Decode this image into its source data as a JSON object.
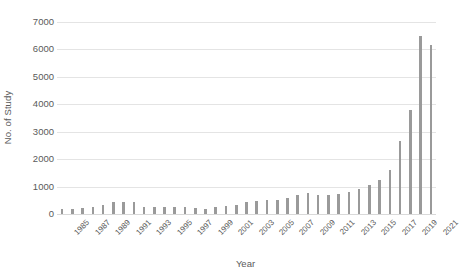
{
  "figure": {
    "background_color": "#ffffff",
    "bar_color": "#9a9a9a",
    "grid_color": "#e4e4e4",
    "text_color": "#5a5a5a"
  },
  "chart_data": {
    "type": "bar",
    "title": "",
    "subtitle": "",
    "xlabel": "Year",
    "ylabel": "No. of Study",
    "ylim": [
      0,
      7000
    ],
    "ytick_values": [
      0,
      1000,
      2000,
      3000,
      4000,
      5000,
      6000,
      7000
    ],
    "ytick_labels": [
      "0",
      "1000",
      "2000",
      "3000",
      "4000",
      "5000",
      "6000",
      "7000"
    ],
    "grid": "horizontal",
    "legend": null,
    "legend_position": "none",
    "xtick_labels": [
      "1985",
      "1987",
      "1989",
      "1991",
      "1993",
      "1995",
      "1997",
      "1999",
      "2001",
      "2003",
      "2005",
      "2007",
      "2009",
      "2011",
      "2013",
      "2015",
      "2017",
      "2019",
      "2021"
    ],
    "xtick_rotation_degrees": 45,
    "categories": [
      "1985",
      "1986",
      "1987",
      "1988",
      "1989",
      "1990",
      "1991",
      "1992",
      "1993",
      "1994",
      "1995",
      "1996",
      "1997",
      "1998",
      "1999",
      "2000",
      "2001",
      "2002",
      "2003",
      "2004",
      "2005",
      "2006",
      "2007",
      "2008",
      "2009",
      "2010",
      "2011",
      "2012",
      "2013",
      "2014",
      "2015",
      "2016",
      "2017",
      "2018",
      "2019",
      "2020",
      "2021"
    ],
    "values": [
      200,
      170,
      230,
      240,
      330,
      430,
      440,
      440,
      250,
      240,
      250,
      250,
      240,
      210,
      180,
      240,
      300,
      330,
      430,
      470,
      500,
      520,
      600,
      700,
      770,
      700,
      710,
      720,
      790,
      900,
      1050,
      1250,
      1600,
      2650,
      3800,
      6500,
      6150
    ],
    "annotations": []
  }
}
